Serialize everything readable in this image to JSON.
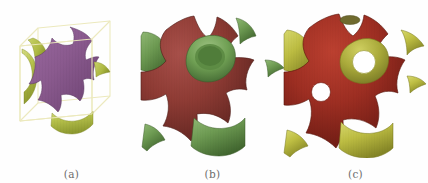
{
  "figure": {
    "type": "scientific-illustration",
    "background_color": "#ffffff",
    "panel_count": 3
  },
  "panels": [
    {
      "id": "a",
      "label": "(a)",
      "description": "Schwarz P minimal surface enclosed in a translucent wireframe unit cube",
      "front_color": "#8a5a8e",
      "front_color_dark": "#5f3b63",
      "back_color": "#b7c24c",
      "back_color_dark": "#8e9a30",
      "wireframe_color": "#ece9bd",
      "has_wireframe_cube": true,
      "has_circular_holes": false,
      "center_x": 70
    },
    {
      "id": "b",
      "label": "(b)",
      "description": "Minimal surface with enlarged necks, red exterior and green interior",
      "front_color": "#8e3b34",
      "front_color_dark": "#5c211d",
      "back_color": "#6d9a52",
      "back_color_dark": "#4a7035",
      "wireframe_color": "#ece9bd",
      "has_wireframe_cube": false,
      "has_circular_holes": false,
      "center_x": 212
    },
    {
      "id": "c",
      "label": "(c)",
      "description": "Minimal surface perforated with circular openings, red exterior and olive-yellow interior",
      "front_color": "#a02e22",
      "front_color_dark": "#6a1a12",
      "back_color": "#bdbd42",
      "back_color_dark": "#8e8e2a",
      "wireframe_color": "#ece9bd",
      "has_wireframe_cube": false,
      "has_circular_holes": true,
      "hole_count": 3,
      "hole_color": "#ffffff",
      "center_x": 355
    }
  ],
  "colors": {
    "purple": "#8a5a8e",
    "yellow_green": "#b7c24c",
    "dark_red": "#8e3b34",
    "green": "#6d9a52",
    "bright_red": "#a02e22",
    "olive_yellow": "#bdbd42",
    "wireframe": "#ece9bd",
    "label_text": "#6d6d6d",
    "background": "#ffffff"
  },
  "labels": {
    "a": "(a)",
    "b": "(b)",
    "c": "(c)"
  }
}
